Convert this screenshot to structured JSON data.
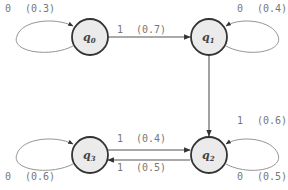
{
  "diagram": {
    "type": "state-transition",
    "nodes": [
      {
        "id": "q0",
        "name": "q",
        "sub": "0"
      },
      {
        "id": "q1",
        "name": "q",
        "sub": "1"
      },
      {
        "id": "q2",
        "name": "q",
        "sub": "2"
      },
      {
        "id": "q3",
        "name": "q",
        "sub": "3"
      }
    ],
    "edges": [
      {
        "from": "q0",
        "to": "q0",
        "symbol": "0",
        "prob": "(0.3)"
      },
      {
        "from": "q0",
        "to": "q1",
        "symbol": "1",
        "prob": "(0.7)"
      },
      {
        "from": "q1",
        "to": "q1",
        "symbol": "0",
        "prob": "(0.4)"
      },
      {
        "from": "q1",
        "to": "q2",
        "symbol": "",
        "prob": ""
      },
      {
        "from": "q2",
        "to": "q2",
        "symbol": "1",
        "prob": "(0.6)"
      },
      {
        "from": "q2",
        "to": "q2",
        "symbol": "0",
        "prob": "(0.5)"
      },
      {
        "from": "q3",
        "to": "q2",
        "symbol": "1",
        "prob": "(0.4)"
      },
      {
        "from": "q2",
        "to": "q3",
        "symbol": "1",
        "prob": "(0.5)"
      },
      {
        "from": "q3",
        "to": "q3",
        "symbol": "0",
        "prob": "(0.6)"
      }
    ]
  }
}
